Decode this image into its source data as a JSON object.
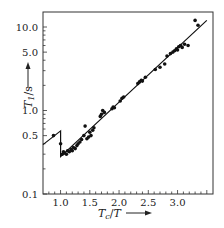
{
  "chart_data": {
    "type": "scatter",
    "title": "",
    "xlabel": "Tc/T",
    "ylabel": "T1/s",
    "xscale": "linear",
    "yscale": "log",
    "xlim": [
      0.7,
      3.6
    ],
    "ylim": [
      0.1,
      13
    ],
    "grid": false,
    "legend": null,
    "x_ticks": [
      1.0,
      1.5,
      2.0,
      2.5,
      3.0
    ],
    "x_tick_labels": [
      "1.0",
      "1.5",
      "2.0",
      "2.5",
      "3.0"
    ],
    "y_ticks": [
      0.1,
      0.5,
      1.0,
      5.0,
      10.0
    ],
    "y_tick_labels": [
      "0.1",
      "0.5",
      "1.0",
      "5.0",
      "10.0"
    ],
    "series": [
      {
        "name": "measured",
        "kind": "points",
        "x": [
          0.88,
          1.0,
          1.03,
          1.05,
          1.07,
          1.1,
          1.12,
          1.15,
          1.18,
          1.2,
          1.22,
          1.25,
          1.28,
          1.3,
          1.33,
          1.36,
          1.4,
          1.42,
          1.45,
          1.48,
          1.5,
          1.52,
          1.55,
          1.57,
          1.68,
          1.7,
          1.72,
          1.75,
          1.88,
          1.9,
          1.92,
          2.02,
          2.05,
          2.08,
          2.32,
          2.35,
          2.38,
          2.4,
          2.45,
          2.62,
          2.7,
          2.78,
          2.82,
          2.88,
          2.92,
          2.95,
          2.98,
          3.0,
          3.02,
          3.05,
          3.08,
          3.12,
          3.18,
          3.3,
          3.35
        ],
        "y": [
          0.5,
          0.4,
          0.3,
          0.32,
          0.31,
          0.3,
          0.33,
          0.32,
          0.34,
          0.33,
          0.36,
          0.35,
          0.38,
          0.4,
          0.42,
          0.45,
          0.5,
          0.65,
          0.46,
          0.48,
          0.55,
          0.5,
          0.58,
          0.62,
          0.85,
          0.9,
          1.0,
          0.95,
          1.05,
          1.1,
          1.08,
          1.3,
          1.4,
          1.45,
          2.1,
          2.2,
          2.3,
          2.25,
          2.5,
          3.1,
          3.3,
          3.6,
          4.5,
          4.8,
          5.0,
          5.2,
          5.5,
          5.3,
          5.8,
          6.0,
          5.7,
          6.2,
          6.0,
          12.0,
          10.5
        ]
      },
      {
        "name": "fit",
        "kind": "line",
        "x": [
          0.7,
          1.0,
          1.0,
          3.5
        ],
        "y": [
          0.39,
          0.57,
          0.28,
          12.0
        ]
      }
    ],
    "annotations": [
      "arrow beside y-axis label",
      "arrow beside x-axis label"
    ]
  }
}
